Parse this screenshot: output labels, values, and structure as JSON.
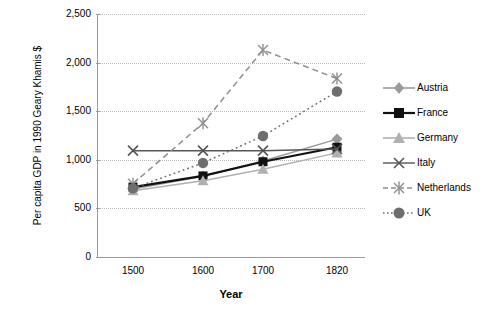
{
  "chart_data": {
    "type": "line",
    "title": "",
    "xlabel": "Year",
    "ylabel": "Per capita GDP in 1990 Geary Khamis $",
    "categories": [
      "1500",
      "1600",
      "1700",
      "1820"
    ],
    "ylim": [
      0,
      2500
    ],
    "yticks": [
      "0",
      "500",
      "1,000",
      "1,500",
      "2,000",
      "2,500"
    ],
    "ytick_values": [
      0,
      500,
      1000,
      1500,
      2000,
      2500
    ],
    "grid": true,
    "legend_position": "right",
    "series": [
      {
        "name": "Austria",
        "marker": "diamond",
        "color": "#9a9a9a",
        "line": "solid",
        "values": [
          707,
          837,
          993,
          1218
        ]
      },
      {
        "name": "France",
        "marker": "square",
        "color": "#111111",
        "line": "solid",
        "values": [
          727,
          841,
          986,
          1135
        ]
      },
      {
        "name": "Germany",
        "marker": "triangle",
        "color": "#b0b0b0",
        "line": "solid",
        "values": [
          688,
          791,
          910,
          1077
        ]
      },
      {
        "name": "Italy",
        "marker": "cross",
        "color": "#555555",
        "line": "solid",
        "values": [
          1100,
          1100,
          1100,
          1117
        ]
      },
      {
        "name": "Netherlands",
        "marker": "asterisk",
        "color": "#8f8f8f",
        "line": "dashed",
        "values": [
          761,
          1381,
          2130,
          1838
        ]
      },
      {
        "name": "UK",
        "marker": "circle",
        "color": "#6e6e6e",
        "line": "dotted",
        "values": [
          714,
          974,
          1250,
          1706
        ]
      }
    ]
  },
  "axis": {
    "xlabel": "Year",
    "ylabel": "Per capita GDP in 1990 Geary Khamis $"
  },
  "legend": {
    "items": [
      {
        "label": "Austria"
      },
      {
        "label": "France"
      },
      {
        "label": "Germany"
      },
      {
        "label": "Italy"
      },
      {
        "label": "Netherlands"
      },
      {
        "label": "UK"
      }
    ]
  },
  "yticks": [
    {
      "label": "2,500"
    },
    {
      "label": "2,000"
    },
    {
      "label": "1,500"
    },
    {
      "label": "1,000"
    },
    {
      "label": "500"
    },
    {
      "label": "0"
    }
  ],
  "xticks": [
    {
      "label": "1500"
    },
    {
      "label": "1600"
    },
    {
      "label": "1700"
    },
    {
      "label": "1820"
    }
  ]
}
